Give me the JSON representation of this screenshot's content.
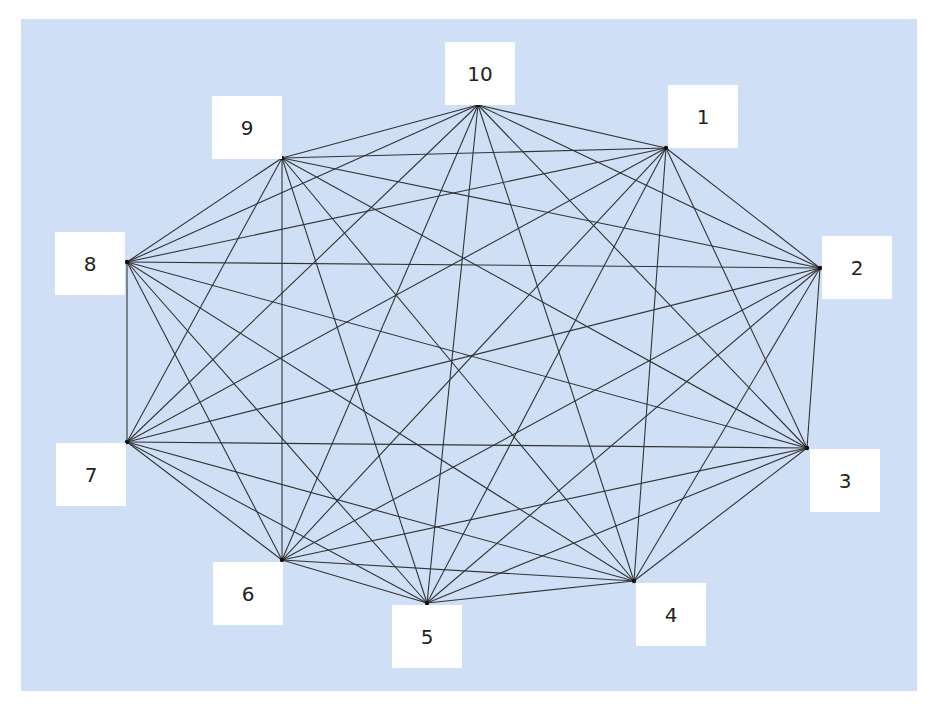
{
  "diagram": {
    "type": "complete-graph",
    "background_color": "#cfe0f6",
    "edge_color": "#333333",
    "label_box_color": "#ffffff",
    "nodes": [
      {
        "id": "1",
        "label": "1",
        "x": 666,
        "y": 148,
        "box": {
          "x": 668,
          "y": 85
        }
      },
      {
        "id": "2",
        "label": "2",
        "x": 820,
        "y": 268,
        "box": {
          "x": 822,
          "y": 236
        }
      },
      {
        "id": "3",
        "label": "3",
        "x": 807,
        "y": 448,
        "box": {
          "x": 810,
          "y": 449
        }
      },
      {
        "id": "4",
        "label": "4",
        "x": 634,
        "y": 581,
        "box": {
          "x": 636,
          "y": 583
        }
      },
      {
        "id": "5",
        "label": "5",
        "x": 427,
        "y": 603,
        "box": {
          "x": 392,
          "y": 605
        }
      },
      {
        "id": "6",
        "label": "6",
        "x": 282,
        "y": 560,
        "box": {
          "x": 213,
          "y": 562
        }
      },
      {
        "id": "7",
        "label": "7",
        "x": 127,
        "y": 442,
        "box": {
          "x": 56,
          "y": 443
        }
      },
      {
        "id": "8",
        "label": "8",
        "x": 127,
        "y": 262,
        "box": {
          "x": 55,
          "y": 232
        }
      },
      {
        "id": "9",
        "label": "9",
        "x": 282,
        "y": 158,
        "box": {
          "x": 212,
          "y": 96
        }
      },
      {
        "id": "10",
        "label": "10",
        "x": 478,
        "y": 105,
        "box": {
          "x": 445,
          "y": 42
        }
      }
    ],
    "edges": "all pairs (K10, 45 edges)"
  }
}
